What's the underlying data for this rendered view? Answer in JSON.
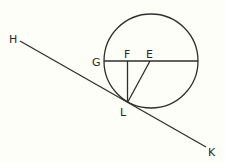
{
  "diagram": {
    "type": "geometry",
    "colors": {
      "background": "#fefef8",
      "line": "#2e2e2e",
      "label": "#2a2a2a"
    },
    "circle": {
      "name": "circle",
      "center": [
        151,
        61
      ],
      "radius": 47
    },
    "segments": [
      {
        "name": "tangent-line-HK",
        "from": "H",
        "to": "K",
        "x1": 20,
        "y1": 41,
        "x2": 206,
        "y2": 147
      },
      {
        "name": "diameter-G-right",
        "from": "G",
        "to": "right",
        "x1": 104,
        "y1": 61,
        "x2": 198,
        "y2": 61
      },
      {
        "name": "segment-FL",
        "from": "F",
        "to": "L",
        "x1": 127.5,
        "y1": 61,
        "x2": 127.5,
        "y2": 102.5
      },
      {
        "name": "segment-EL",
        "from": "E",
        "to": "L",
        "x1": 150,
        "y1": 61,
        "x2": 127.5,
        "y2": 102.5
      }
    ],
    "labels": [
      {
        "name": "label-H",
        "text": "H",
        "x": 9,
        "y": 43
      },
      {
        "name": "label-G",
        "text": "G",
        "x": 92,
        "y": 66
      },
      {
        "name": "label-F",
        "text": "F",
        "x": 124,
        "y": 58
      },
      {
        "name": "label-E",
        "text": "E",
        "x": 146,
        "y": 58
      },
      {
        "name": "label-L",
        "text": "L",
        "x": 120,
        "y": 116
      },
      {
        "name": "label-K",
        "text": "K",
        "x": 208,
        "y": 156
      }
    ]
  }
}
